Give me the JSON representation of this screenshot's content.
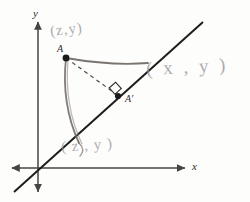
{
  "figure": {
    "kind": "hand-annotated-geometry-sketch",
    "background_color": "#fdfdfc",
    "axes": {
      "x_label": "x",
      "y_label": "y",
      "axis_color": "#444444",
      "origin": {
        "x": 38,
        "y": 168
      }
    },
    "mirror_line": {
      "name": "reflection-line",
      "color": "#1d1d1d",
      "from": {
        "x": 14,
        "y": 192
      },
      "to": {
        "x": 203,
        "y": 22
      }
    },
    "points": [
      {
        "id": "A",
        "label": "A",
        "color": "#1a1a1a",
        "x": 66,
        "y": 58,
        "label_offset": {
          "x": -9,
          "y": -12
        }
      },
      {
        "id": "A-prime",
        "label": "A'",
        "color": "#1a1a1a",
        "x": 118,
        "y": 96,
        "label_offset": {
          "x": 6,
          "y": -2
        }
      }
    ],
    "dashed_segment": {
      "name": "perpendicular-from-A",
      "color": "#4a4a4a",
      "from": {
        "x": 66,
        "y": 58
      },
      "to": {
        "x": 118,
        "y": 96
      }
    },
    "right_angle_marker": {
      "name": "right-angle-square",
      "color": "#2a2a2a",
      "x": 113,
      "y": 88,
      "size": 8
    },
    "pen_strokes": [
      {
        "name": "stroke-A-to-line-upper",
        "color": "#6b655f",
        "path": "M 66 58 Q 112 66 148 63"
      },
      {
        "name": "stroke-A-down-to-line",
        "color": "#6b655f",
        "path": "M 66 58 Q 61 104 79 143"
      }
    ],
    "annotations": [
      {
        "id": "note-top",
        "text": "(z,y)",
        "x": 50,
        "y": 22,
        "tilt": "tilt-a"
      },
      {
        "id": "note-right",
        "text": "( x , y )",
        "x": 146,
        "y": 57,
        "tilt": "tilt-c"
      },
      {
        "id": "note-bottom",
        "text": "( z , y )",
        "x": 61,
        "y": 138,
        "tilt": "tilt-b"
      }
    ]
  }
}
